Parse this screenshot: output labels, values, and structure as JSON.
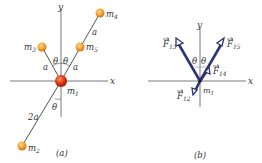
{
  "panel_a": {
    "caption": "(a)",
    "axes": {
      "x": "x",
      "y": "y"
    },
    "masses": [
      {
        "id": "m1",
        "label": "m",
        "sub": "1"
      },
      {
        "id": "m2",
        "label": "m",
        "sub": "2"
      },
      {
        "id": "m3",
        "label": "m",
        "sub": "3"
      },
      {
        "id": "m4",
        "label": "m",
        "sub": "4"
      },
      {
        "id": "m5",
        "label": "m",
        "sub": "5"
      }
    ],
    "lengths": {
      "a_left": "a",
      "a_right": "a",
      "a_upper": "a",
      "two_a": "2a"
    },
    "angles": {
      "theta_left": "θ",
      "theta_right": "θ",
      "theta_lower": "θ"
    },
    "colors": {
      "ball": "#f0a030",
      "center_ball": "#d83010",
      "line": "#555555"
    }
  },
  "panel_b": {
    "caption": "(b)",
    "axes": {
      "x": "x",
      "y": "y"
    },
    "origin_label": {
      "label": "m",
      "sub": "1"
    },
    "forces": [
      {
        "id": "F13",
        "label": "F",
        "sub": "13"
      },
      {
        "id": "F15",
        "label": "F",
        "sub": "15"
      },
      {
        "id": "F14",
        "label": "F",
        "sub": "14"
      },
      {
        "id": "F12",
        "label": "F",
        "sub": "12"
      }
    ],
    "angles": {
      "theta_left": "θ",
      "theta_right": "θ"
    },
    "colors": {
      "arrow": "#2e3470"
    }
  }
}
